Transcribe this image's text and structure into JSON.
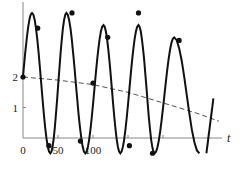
{
  "chart_data": {
    "type": "line",
    "title": "",
    "xlabel": "t",
    "ylabel": "",
    "xlim": [
      0,
      300
    ],
    "ylim": [
      -0.5,
      4.4
    ],
    "grid": false,
    "x_ticks": [
      {
        "value": 0,
        "label": "0"
      },
      {
        "value": 50,
        "label": "50"
      },
      {
        "value": 100,
        "label": "100"
      },
      {
        "value": 150,
        "label": ""
      },
      {
        "value": 200,
        "label": ""
      }
    ],
    "y_ticks": [
      {
        "value": 1,
        "label": "1"
      },
      {
        "value": 2,
        "label": "2"
      }
    ],
    "series": [
      {
        "name": "oscillation",
        "style": "solid",
        "color": "#111111",
        "description": "large-amplitude oscillation starting at 2, period about 52, peaks decreasing slightly over time",
        "start": 2,
        "period": 52,
        "peaks": [
          [
            13,
            4.1
          ],
          [
            62,
            4.1
          ],
          [
            115,
            3.7
          ],
          [
            165,
            3.7
          ],
          [
            216,
            3.3
          ]
        ],
        "troughs": [
          [
            39,
            -0.5
          ],
          [
            89,
            -0.5
          ],
          [
            139,
            -0.5
          ],
          [
            188,
            -0.5
          ]
        ],
        "end_t": 272,
        "markers": [
          [
            0,
            2
          ],
          [
            21,
            3.6
          ],
          [
            37,
            -0.25
          ],
          [
            70,
            4.1
          ],
          [
            82,
            -0.1
          ],
          [
            100,
            1.8
          ],
          [
            121,
            3.3
          ],
          [
            152,
            -0.25
          ],
          [
            165,
            4.1
          ],
          [
            185,
            -0.5
          ],
          [
            223,
            3.2
          ]
        ]
      },
      {
        "name": "trend",
        "style": "dashed",
        "color": "#555555",
        "points": [
          [
            0,
            2
          ],
          [
            50,
            1.9
          ],
          [
            100,
            1.75
          ],
          [
            150,
            1.5
          ],
          [
            200,
            1.15
          ],
          [
            250,
            0.8
          ],
          [
            280,
            0.55
          ]
        ]
      }
    ]
  }
}
